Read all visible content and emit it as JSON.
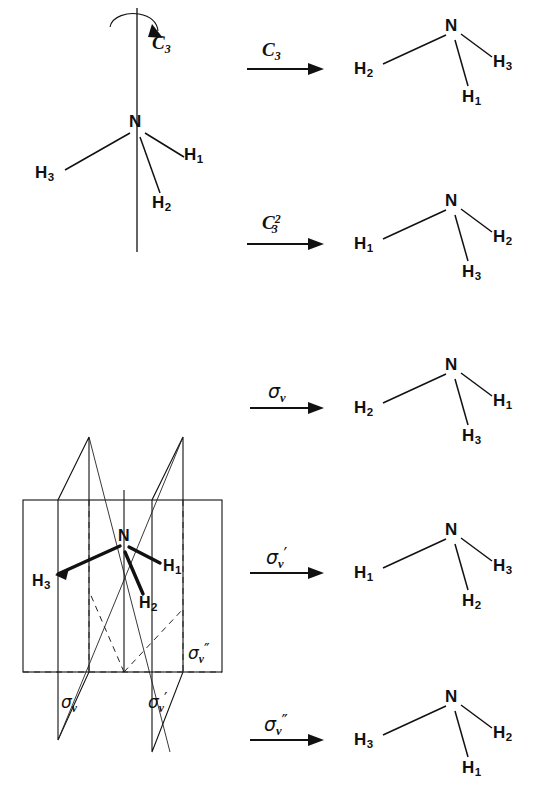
{
  "figure": {
    "center_atom": "N",
    "hydrogen_labels": [
      "H",
      "H",
      "H"
    ],
    "subscripts": [
      "1",
      "2",
      "3"
    ],
    "ink_color": "#111111",
    "background_color": "#ffffff"
  },
  "source": {
    "label": "starting-configuration",
    "center": "N",
    "left": {
      "element": "H",
      "index": "3"
    },
    "right": {
      "element": "H",
      "index": "1"
    },
    "bottom": {
      "element": "H",
      "index": "2"
    },
    "axis_label": {
      "symbol": "C",
      "sub": "3",
      "sup": ""
    }
  },
  "rows": [
    {
      "id": "c3",
      "operation": {
        "symbol": "C",
        "sub": "3",
        "sup": "",
        "primes": ""
      },
      "operation_text": "C3",
      "result": {
        "center": "N",
        "left": {
          "element": "H",
          "index": "2"
        },
        "right": {
          "element": "H",
          "index": "3"
        },
        "bottom": {
          "element": "H",
          "index": "1"
        }
      }
    },
    {
      "id": "c3-squared",
      "operation": {
        "symbol": "C",
        "sub": "3",
        "sup": "2",
        "primes": ""
      },
      "operation_text": "C3^2",
      "result": {
        "center": "N",
        "left": {
          "element": "H",
          "index": "1"
        },
        "right": {
          "element": "H",
          "index": "2"
        },
        "bottom": {
          "element": "H",
          "index": "3"
        }
      }
    },
    {
      "id": "sigma-v",
      "operation": {
        "symbol": "σ",
        "sub": "v",
        "sup": "",
        "primes": ""
      },
      "operation_text": "sigma_v",
      "result": {
        "center": "N",
        "left": {
          "element": "H",
          "index": "2"
        },
        "right": {
          "element": "H",
          "index": "1"
        },
        "bottom": {
          "element": "H",
          "index": "3"
        }
      }
    },
    {
      "id": "sigma-v-prime",
      "operation": {
        "symbol": "σ",
        "sub": "v",
        "sup": "",
        "primes": "′"
      },
      "operation_text": "sigma_v'",
      "result": {
        "center": "N",
        "left": {
          "element": "H",
          "index": "1"
        },
        "right": {
          "element": "H",
          "index": "3"
        },
        "bottom": {
          "element": "H",
          "index": "2"
        }
      }
    },
    {
      "id": "sigma-v-double-prime",
      "operation": {
        "symbol": "σ",
        "sub": "v",
        "sup": "",
        "primes": "″"
      },
      "operation_text": "sigma_v''",
      "result": {
        "center": "N",
        "left": {
          "element": "H",
          "index": "3"
        },
        "right": {
          "element": "H",
          "index": "2"
        },
        "bottom": {
          "element": "H",
          "index": "1"
        }
      }
    }
  ],
  "planes_diagram": {
    "center": "N",
    "left": {
      "element": "H",
      "index": "3"
    },
    "right": {
      "element": "H",
      "index": "1"
    },
    "bottom": {
      "element": "H",
      "index": "2"
    },
    "planes": [
      {
        "id": "sigma-v",
        "symbol": "σ",
        "sub": "v",
        "primes": ""
      },
      {
        "id": "sigma-v-prime",
        "symbol": "σ",
        "sub": "v",
        "primes": "′"
      },
      {
        "id": "sigma-v-double-prime",
        "symbol": "σ",
        "sub": "v",
        "primes": "″"
      }
    ]
  }
}
